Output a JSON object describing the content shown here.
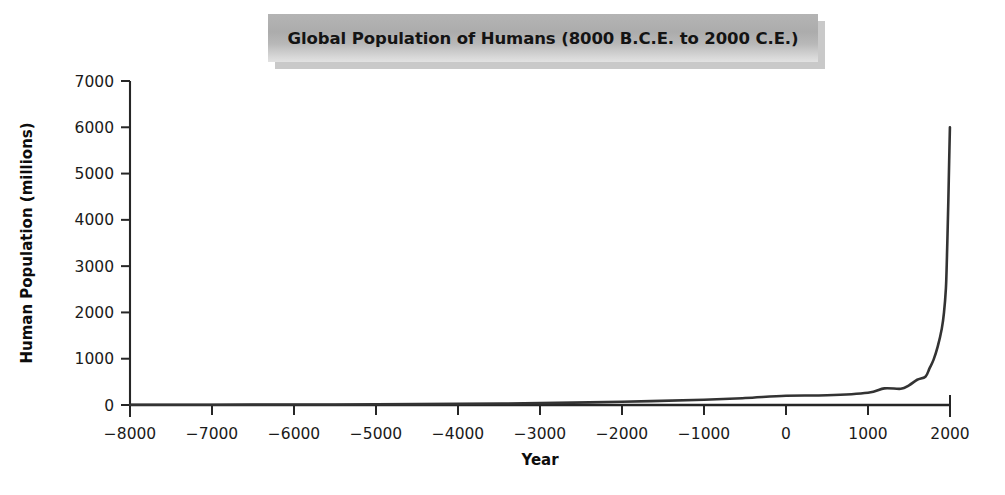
{
  "chart_data": {
    "type": "line",
    "title": "Global Population of Humans (8000 B.C.E. to 2000 C.E.)",
    "xlabel": "Year",
    "ylabel": "Human Population (millions)",
    "xlim": [
      -8000,
      2000
    ],
    "ylim": [
      0,
      7000
    ],
    "xticks": [
      -8000,
      -7000,
      -6000,
      -5000,
      -4000,
      -3000,
      -2000,
      -1000,
      0,
      1000,
      2000
    ],
    "xtick_labels": [
      "−8000",
      "−7000",
      "−6000",
      "−5000",
      "−4000",
      "−3000",
      "−2000",
      "−1000",
      "0",
      "1000",
      "2000"
    ],
    "yticks": [
      0,
      1000,
      2000,
      3000,
      4000,
      5000,
      6000,
      7000
    ],
    "ytick_labels": [
      "0",
      "1000",
      "2000",
      "3000",
      "4000",
      "5000",
      "6000",
      "7000"
    ],
    "grid": false,
    "legend": false,
    "line_color": "#333333",
    "series": [
      {
        "name": "Global human population",
        "x": [
          -8000,
          -7000,
          -6000,
          -5000,
          -4000,
          -3000,
          -2000,
          -1000,
          -500,
          0,
          500,
          1000,
          1200,
          1400,
          1500,
          1600,
          1700,
          1750,
          1800,
          1850,
          1900,
          1927,
          1950,
          1960,
          1970,
          1980,
          1990,
          1999
        ],
        "values": [
          5,
          7,
          10,
          15,
          25,
          40,
          70,
          115,
          150,
          200,
          210,
          265,
          360,
          350,
          425,
          545,
          610,
          790,
          980,
          1260,
          1650,
          2000,
          2520,
          3020,
          3700,
          4430,
          5280,
          6000
        ]
      }
    ]
  },
  "figure": {
    "title_banner_label": "Global Population of Humans (8000 B.C.E. to 2000 C.E.)"
  }
}
